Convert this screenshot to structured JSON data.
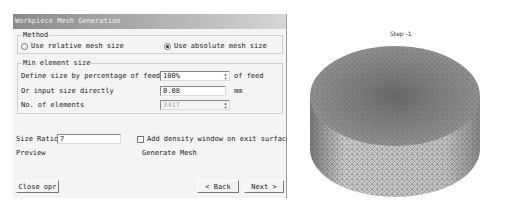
{
  "window": {
    "title": "Workpiece Mesh Generation"
  },
  "method": {
    "legend": "Method",
    "options": [
      {
        "label": "Use relative mesh size",
        "selected": false
      },
      {
        "label": "Use absolute mesh size",
        "selected": true
      }
    ]
  },
  "min_element": {
    "legend": "Min element size",
    "rows": [
      {
        "label": "Define size by percentage of feed",
        "value": "100%",
        "unit": "of feed"
      },
      {
        "label": "Or input size directly",
        "value": "0.08",
        "unit": "mm"
      },
      {
        "label": "No. of elements",
        "value": "3417",
        "unit": ""
      }
    ]
  },
  "size_ratio": {
    "label": "Size Ratio",
    "value": "7"
  },
  "density_checkbox": {
    "label": "Add density window on exit surface",
    "checked": false
  },
  "links": {
    "preview": "Preview",
    "generate": "Generate Mesh"
  },
  "buttons": {
    "close": "Close opr",
    "back": "< Back",
    "next": "Next >"
  },
  "viewport": {
    "step_label": "Step -1"
  },
  "colors": {
    "titlebar": "#8a8a8a",
    "mesh_top": "#7a7a7a",
    "mesh_side": "#c8c8c8"
  }
}
